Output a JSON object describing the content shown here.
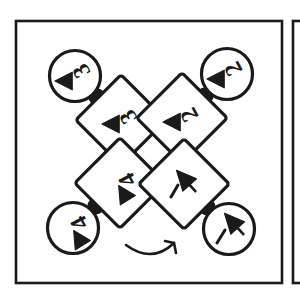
{
  "figure": {
    "type": "patent-style-diagram",
    "background_color": "#ffffff",
    "ink_color": "#1a1a1a",
    "stroke_color": "#1a1a1a",
    "fill_color": "#ffffff",
    "frame": {
      "name": "main-panel-border",
      "x": 16,
      "y": 21,
      "width": 266,
      "height": 262,
      "stroke_width": 2.6
    },
    "adjacent_panel": {
      "name": "adjacent-panel-edge",
      "x": 293,
      "y": 21,
      "width": 14,
      "height": 262,
      "stroke_width": 2.6
    },
    "units": [
      {
        "id": "unit-3",
        "label": "3",
        "position": "top-left",
        "circle": {
          "cx": 75,
          "cy": 76,
          "r": 25.5,
          "stroke_width": 3.2
        },
        "circle_label_rotation": -118,
        "circle_arrow_rotation": -90,
        "diamond": {
          "cx": 121,
          "cy": 120,
          "half": 32,
          "rotation": 45,
          "stroke_width": 3.2
        },
        "diamond_label_rotation": -118,
        "diamond_arrow_rotation": -90,
        "connector": {
          "cx": 97,
          "cy": 97,
          "r": 7.5
        }
      },
      {
        "id": "unit-2",
        "label": "2",
        "position": "top-right",
        "circle": {
          "cx": 227,
          "cy": 74,
          "r": 25.5,
          "stroke_width": 3.2
        },
        "circle_label_rotation": -118,
        "circle_arrow_rotation": -90,
        "diamond": {
          "cx": 182,
          "cy": 118,
          "half": 32,
          "rotation": 45,
          "stroke_width": 3.2
        },
        "diamond_label_rotation": -118,
        "diamond_arrow_rotation": -90,
        "connector": {
          "cx": 205,
          "cy": 96,
          "r": 7.5
        }
      },
      {
        "id": "unit-4",
        "label": "4",
        "position": "bottom-left",
        "circle": {
          "cx": 73,
          "cy": 228,
          "r": 25.5,
          "stroke_width": 3.2
        },
        "circle_label_rotation": -118,
        "circle_arrow_rotation": -32,
        "diamond": {
          "cx": 120,
          "cy": 183,
          "half": 32,
          "rotation": 45,
          "stroke_width": 3.2
        },
        "diamond_label_rotation": -118,
        "diamond_arrow_rotation": -32,
        "connector": {
          "cx": 96,
          "cy": 206,
          "r": 7.5
        }
      },
      {
        "id": "unit-1",
        "label": "1",
        "position": "bottom-right",
        "circle": {
          "cx": 229,
          "cy": 229,
          "r": 25.5,
          "stroke_width": 3.2
        },
        "circle_label_rotation": -28,
        "circle_arrow_rotation": -42,
        "diamond": {
          "cx": 184,
          "cy": 184,
          "half": 32,
          "rotation": 45,
          "stroke_width": 3.2
        },
        "diamond_label_rotation": -28,
        "diamond_arrow_rotation": -42,
        "connector": {
          "cx": 207,
          "cy": 207,
          "r": 7.5
        }
      }
    ],
    "rotation_arrow": {
      "name": "rotation-direction-arrow",
      "description": "curved arrow indicating clockwise rotation",
      "path": "M 126 245 Q 152 264 174 243",
      "head": "M 174 243 L 176 253 M 174 243 L 165 241",
      "stroke_width": 2.6
    }
  }
}
